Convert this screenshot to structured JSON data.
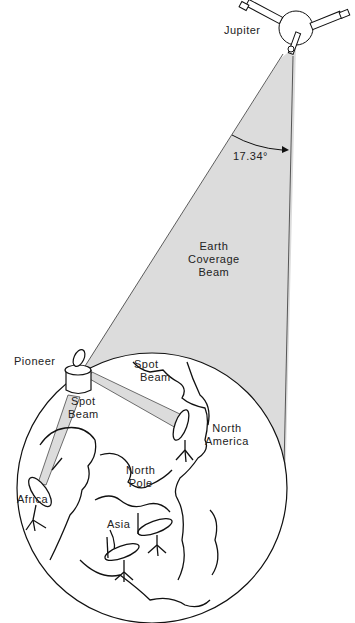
{
  "diagram": {
    "colors": {
      "beam_fill": "#dcdcdc",
      "line": "#111111",
      "text": "#222222",
      "background": "#ffffff"
    },
    "labels": {
      "jupiter": "Jupiter",
      "angle": "17.34°",
      "earth_beam_line1": "Earth",
      "earth_beam_line2": "Coverage",
      "earth_beam_line3": "Beam",
      "pioneer": "Pioneer",
      "spot_beam_left_line1": "Spot",
      "spot_beam_left_line2": "Beam",
      "spot_beam_right_line1": "Spot",
      "spot_beam_right_line2": "Beam",
      "north_america_line1": "North",
      "north_america_line2": "America",
      "north_pole_line1": "North",
      "north_pole_line2": "Pole",
      "africa": "Africa",
      "asia": "Asia"
    },
    "nodes": [
      {
        "id": "jupiter-spacecraft",
        "label": "Jupiter"
      },
      {
        "id": "pioneer-spacecraft",
        "label": "Pioneer"
      },
      {
        "id": "earth-globe",
        "label": ""
      },
      {
        "id": "dish-africa",
        "label": "Africa"
      },
      {
        "id": "dish-north-america",
        "label": "North America"
      },
      {
        "id": "dish-asia-1",
        "label": "Asia"
      },
      {
        "id": "dish-asia-2",
        "label": "Asia"
      }
    ],
    "edges": [
      {
        "from": "jupiter-spacecraft",
        "to": "earth-globe",
        "label": "Earth Coverage Beam"
      },
      {
        "from": "pioneer-spacecraft",
        "to": "dish-africa",
        "label": "Spot Beam"
      },
      {
        "from": "pioneer-spacecraft",
        "to": "dish-north-america",
        "label": "Spot Beam"
      }
    ]
  }
}
